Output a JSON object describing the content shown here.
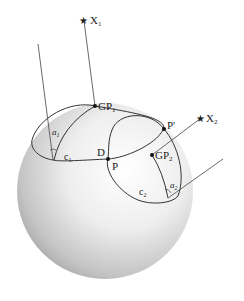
{
  "diagram": {
    "type": "celestial-navigation-sphere",
    "colors": {
      "line": "#333333",
      "sphere_light": "#fbfbfb",
      "sphere_dark": "#9a9a9a",
      "text": "#222222"
    },
    "labels": {
      "x1": "X",
      "x1_sub": "1",
      "x2": "X",
      "x2_sub": "2",
      "gp1": "GP",
      "gp1_sub": "1",
      "gp2": "GP",
      "gp2_sub": "2",
      "a1": "a",
      "a1_sub": "1",
      "a2": "a",
      "a2_sub": "2",
      "c1": "c",
      "c1_sub": "1",
      "c2": "c",
      "c2_sub": "2",
      "d": "D",
      "p": "P",
      "p_prime": "P'"
    },
    "icons": {
      "star_glyph": "★"
    }
  }
}
